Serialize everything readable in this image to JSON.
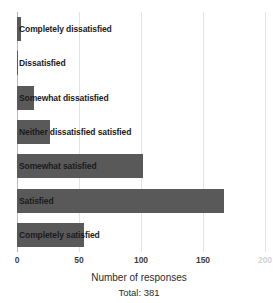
{
  "chart_data": {
    "type": "bar",
    "orientation": "horizontal",
    "title": "",
    "subtitle": "",
    "xlabel": "Number of responses",
    "ylabel": "",
    "xlim": [
      0,
      200
    ],
    "grid": true,
    "legend": null,
    "bar_color": "#595959",
    "background_color": "#ffffff",
    "gridline_color": "#e3e3e3",
    "xticks": [
      0,
      50,
      100,
      150
    ],
    "xtick_labels": [
      "0",
      "50",
      "100",
      "150"
    ],
    "xtick_clipped_right": "200",
    "categories": [
      "Completely dissatisfied",
      "Dissatisfied",
      "Somewhat dissatisfied",
      "Neither dissatisfied satisfied",
      "Somewhat satisfied",
      "Satisfied",
      "Completely satisfied"
    ],
    "values": [
      3,
      1,
      14,
      27,
      102,
      167,
      54
    ],
    "annotations": {
      "total_label": "Total: 381",
      "total_value": 381
    }
  }
}
